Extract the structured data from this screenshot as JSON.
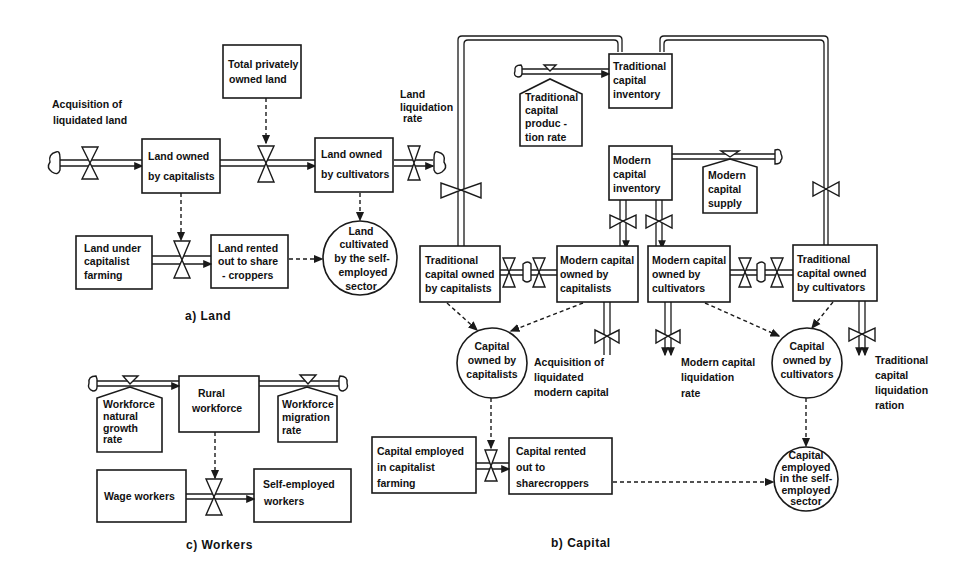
{
  "panels": {
    "land": {
      "caption": "a) Land",
      "stocks": {
        "total_privately_owned": [
          "Total privately",
          "owned land"
        ],
        "owned_by_capitalists": [
          "Land owned",
          "by capitalists"
        ],
        "owned_by_cultivators": [
          "Land owned",
          "by cultivators"
        ],
        "under_capitalist_farming": [
          "Land under",
          "capitalist",
          "farming"
        ],
        "rented_to_sharecroppers": [
          "Land rented",
          "out to share",
          "- croppers"
        ]
      },
      "auxiliaries": {
        "cultivated_self_employed": [
          "Land",
          "cultivated",
          "by the self-",
          "employed",
          "sector"
        ]
      },
      "rates": {
        "acquisition": [
          "Acquisition of",
          "liquidated land"
        ],
        "liquidation": [
          "Land",
          "liquidation",
          "rate"
        ]
      }
    },
    "capital": {
      "caption": "b) Capital",
      "stocks": {
        "traditional_inventory": [
          "Traditional",
          "capital",
          "inventory"
        ],
        "modern_inventory": [
          "Modern",
          "capital",
          "inventory"
        ],
        "traditional_capitalists": [
          "Traditional",
          "capital owned",
          "by capitalists"
        ],
        "modern_capitalists": [
          "Modern capital",
          "owned by",
          "capitalists"
        ],
        "modern_cultivators": [
          "Modern capital",
          "owned by",
          "cultivators"
        ],
        "traditional_cultivators": [
          "Traditional",
          "capital owned",
          "by cultivators"
        ],
        "employed_capitalist_farming": [
          "Capital employed",
          "in capitalist",
          "farming"
        ],
        "rented_sharecroppers": [
          "Capital rented",
          "out to",
          "sharecroppers"
        ]
      },
      "sources": {
        "traditional_production_rate": [
          "Traditional",
          "capital",
          "produc -",
          "tion rate"
        ],
        "modern_supply": [
          "Modern",
          "capital",
          "supply"
        ]
      },
      "auxiliaries": {
        "owned_by_capitalists": [
          "Capital",
          "owned by",
          "capitalists"
        ],
        "owned_by_cultivators": [
          "Capital",
          "owned by",
          "cultivators"
        ],
        "employed_self_employed": [
          "Capital",
          "employed",
          "in the self-",
          "employed",
          "sector"
        ]
      },
      "rates": {
        "acquisition_modern": [
          "Acquisition of",
          "liquidated",
          "modern capital"
        ],
        "modern_liquidation": [
          "Modern capital",
          "liquidation",
          "rate"
        ],
        "traditional_liquidation": [
          "Traditional",
          "capital",
          "liquidation",
          "ration"
        ]
      }
    },
    "workers": {
      "caption": "c) Workers",
      "stocks": {
        "rural_workforce": [
          "Rural",
          "workforce"
        ],
        "wage_workers": [
          "Wage workers"
        ],
        "self_employed_workers": [
          "Self-employed",
          "workers"
        ]
      },
      "sources": {
        "natural_growth": [
          "Workforce",
          "natural",
          "growth",
          "rate"
        ],
        "migration": [
          "Workforce",
          "migration",
          "rate"
        ]
      }
    }
  }
}
